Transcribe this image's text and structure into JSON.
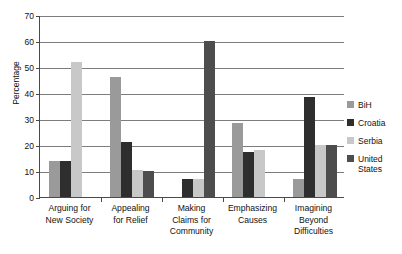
{
  "chart_data": {
    "type": "bar",
    "title": "",
    "subtitle": "",
    "xlabel": "",
    "ylabel": "Percentage",
    "ylim": [
      0,
      70
    ],
    "ytick_step": 10,
    "yticks": [
      0,
      10,
      20,
      30,
      40,
      50,
      60,
      70
    ],
    "ytick_labels": [
      "0",
      "10",
      "20",
      "30",
      "40",
      "50",
      "60",
      "70"
    ],
    "grid": "horizontal",
    "legend_position": "right",
    "categories": [
      "Arguing for New Society",
      "Appealing for Relief",
      "Making Claims for Community",
      "Emphasizing Causes",
      "Imagining Beyond Difficulties"
    ],
    "category_lines": [
      [
        "Arguing for",
        "New Society"
      ],
      [
        "Appealing",
        "for Relief"
      ],
      [
        "Making",
        "Claims for",
        "Community"
      ],
      [
        "Emphasizing",
        "Causes"
      ],
      [
        "Imagining",
        "Beyond",
        "Difficulties"
      ]
    ],
    "series": [
      {
        "name": "BiH",
        "color": "#9a9a9a",
        "values": [
          14,
          46,
          0,
          28.5,
          7
        ]
      },
      {
        "name": "Croatia",
        "color": "#2e2e2e",
        "values": [
          14,
          21,
          7,
          17.5,
          38.5
        ]
      },
      {
        "name": "Serbia",
        "color": "#c8c8c8",
        "values": [
          52,
          10.5,
          7,
          18,
          20
        ]
      },
      {
        "name": "United States",
        "color": "#4d4d4d",
        "values": [
          0,
          10,
          60,
          0,
          20
        ]
      }
    ]
  },
  "legend": {
    "entries": [
      {
        "label": "BiH",
        "color": "#9a9a9a"
      },
      {
        "label": "Croatia",
        "color": "#2e2e2e"
      },
      {
        "label": "Serbia",
        "color": "#c8c8c8"
      },
      {
        "label": "United States",
        "color": "#4d4d4d"
      }
    ]
  },
  "colors": {
    "axis": "#4a4a4a",
    "grid": "#7d7d7d",
    "text": "#111111",
    "background": "#ffffff"
  }
}
